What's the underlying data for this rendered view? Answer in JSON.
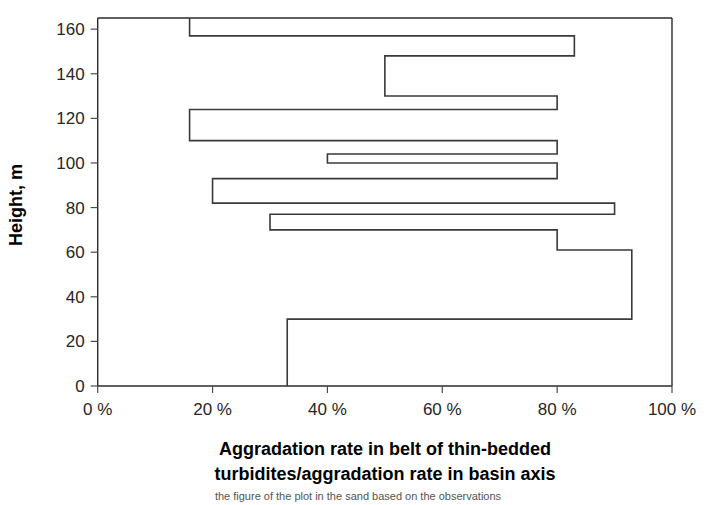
{
  "chart_data": {
    "type": "line",
    "title": "",
    "xlabel": "Aggradation rate in belt of thin-bedded turbidites/aggradation rate in basin axis",
    "ylabel": "Height, m",
    "orientation": "horizontal-step",
    "xlim": [
      0,
      100
    ],
    "ylim": [
      0,
      165
    ],
    "grid": false,
    "legend": null,
    "xticks": [
      0,
      20,
      40,
      60,
      80,
      100
    ],
    "xtick_labels": [
      "0 %",
      "20 %",
      "40 %",
      "60 %",
      "80 %",
      "100 %"
    ],
    "yticks": [
      0,
      20,
      40,
      60,
      80,
      100,
      120,
      140,
      160
    ],
    "ytick_labels": [
      "0",
      "20",
      "40",
      "60",
      "80",
      "100",
      "120",
      "140",
      "160"
    ],
    "x_unit": "%",
    "y_unit": "m",
    "steps": [
      {
        "height_from": 0,
        "height_to": 30,
        "value": 33
      },
      {
        "height_from": 30,
        "height_to": 61,
        "value": 93
      },
      {
        "height_from": 61,
        "height_to": 70,
        "value": 80
      },
      {
        "height_from": 70,
        "height_to": 77,
        "value": 30
      },
      {
        "height_from": 77,
        "height_to": 82,
        "value": 90
      },
      {
        "height_from": 82,
        "height_to": 93,
        "value": 20
      },
      {
        "height_from": 93,
        "height_to": 100,
        "value": 80
      },
      {
        "height_from": 100,
        "height_to": 104,
        "value": 40
      },
      {
        "height_from": 104,
        "height_to": 110,
        "value": 80
      },
      {
        "height_from": 110,
        "height_to": 124,
        "value": 16
      },
      {
        "height_from": 124,
        "height_to": 130,
        "value": 80
      },
      {
        "height_from": 130,
        "height_to": 148,
        "value": 50
      },
      {
        "height_from": 148,
        "height_to": 157,
        "value": 83
      },
      {
        "height_from": 157,
        "height_to": 165,
        "value": 16
      }
    ]
  },
  "axes": {
    "y_title": "Height, m",
    "x_title_line1": "Aggradation rate in belt of thin-bedded",
    "x_title_line2": "turbidites/aggradation rate in basin axis"
  },
  "colors": {
    "line": "#3a3a3a",
    "axis": "#2b2b2b",
    "text": "#262626",
    "background": "#ffffff"
  },
  "caption": {
    "text": "the figure of the plot in the sand based on the observations"
  }
}
